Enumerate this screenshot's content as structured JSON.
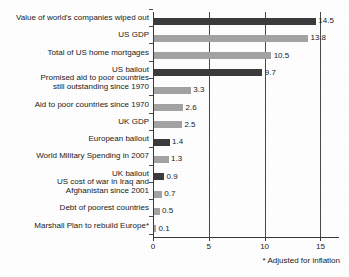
{
  "chart_data": {
    "type": "bar",
    "orientation": "horizontal",
    "title": "",
    "subtitle": "",
    "xlabel": "",
    "ylabel": "",
    "xlim": [
      0,
      16.6
    ],
    "ylim": null,
    "grid": "vertical",
    "legend": null,
    "xticks": [
      "0",
      "5",
      "10",
      "15"
    ],
    "xtick_values": [
      0,
      5,
      10,
      15
    ],
    "footnote": "* Adjusted for inflation",
    "colors": {
      "dark_bar": "#3b3b3b",
      "light_bar": "#a3a3a3",
      "axis": "#3a3a3a",
      "grid": "#4a4a4a",
      "text": "#1a1a1a",
      "background": "#fefefe"
    },
    "categories": [
      "Value of world's companies wiped out",
      "US GDP",
      "Total of US home mortgages",
      "US bailout",
      "Promised aid to poor countries\nstill outstanding since 1970",
      "Aid to poor countries since 1970",
      "UK GDP",
      "European bailout",
      "World Military Spending in 2007",
      "UK bailout",
      "US cost of war in Iraq and\nAfghanistan since 2001",
      "Debt of poorest countries",
      "Marshall Plan to rebuild Europe*"
    ],
    "values": [
      14.5,
      13.8,
      10.5,
      9.7,
      3.3,
      2.6,
      2.5,
      1.4,
      1.3,
      0.9,
      0.7,
      0.5,
      0.1
    ],
    "value_labels": [
      "14.5",
      "13.8",
      "10.5",
      "9.7",
      "3.3",
      "2.6",
      "2.5",
      "1.4",
      "1.3",
      "0.9",
      "0.7",
      "0.5",
      "0.1"
    ],
    "bar_shades": [
      "dark",
      "light",
      "light",
      "dark",
      "light",
      "light",
      "light",
      "dark",
      "light",
      "dark",
      "light",
      "light",
      "light"
    ],
    "bars": [
      {
        "label": "Value of world's companies wiped out",
        "value": 14.5,
        "value_label": "14.5",
        "shade": "dark"
      },
      {
        "label": "US GDP",
        "value": 13.8,
        "value_label": "13.8",
        "shade": "light"
      },
      {
        "label": "Total of US home mortgages",
        "value": 10.5,
        "value_label": "10.5",
        "shade": "light"
      },
      {
        "label": "US bailout",
        "value": 9.7,
        "value_label": "9.7",
        "shade": "dark"
      },
      {
        "label": "Promised aid to poor countries\nstill outstanding since 1970",
        "value": 3.3,
        "value_label": "3.3",
        "shade": "light"
      },
      {
        "label": "Aid to poor countries since 1970",
        "value": 2.6,
        "value_label": "2.6",
        "shade": "light"
      },
      {
        "label": "UK GDP",
        "value": 2.5,
        "value_label": "2.5",
        "shade": "light"
      },
      {
        "label": "European bailout",
        "value": 1.4,
        "value_label": "1.4",
        "shade": "dark"
      },
      {
        "label": "World Military Spending in 2007",
        "value": 1.3,
        "value_label": "1.3",
        "shade": "light"
      },
      {
        "label": "UK bailout",
        "value": 0.9,
        "value_label": "0.9",
        "shade": "dark"
      },
      {
        "label": "US cost of war in Iraq and\nAfghanistan since 2001",
        "value": 0.7,
        "value_label": "0.7",
        "shade": "light"
      },
      {
        "label": "Debt of poorest countries",
        "value": 0.5,
        "value_label": "0.5",
        "shade": "light"
      },
      {
        "label": "Marshall Plan to rebuild Europe*",
        "value": 0.1,
        "value_label": "0.1",
        "shade": "light"
      }
    ]
  }
}
